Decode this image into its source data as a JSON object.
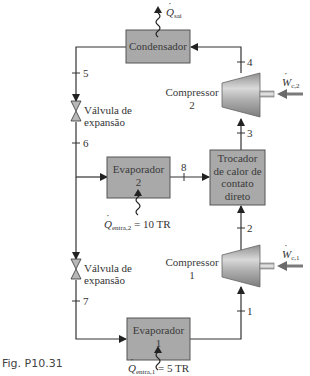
{
  "figure": {
    "caption": "Fig. P10.31",
    "colors": {
      "box_fill": "#a9a9a9",
      "line": "#333333",
      "compressor_light": "#d8d8d8",
      "compressor_dark": "#8a8a8a",
      "work_arrow": "#7a7a7a"
    }
  },
  "components": {
    "condenser": {
      "label": "Condensador"
    },
    "compressor2": {
      "label_line1": "Compressor",
      "label_line2": "2"
    },
    "compressor1": {
      "label_line1": "Compressor",
      "label_line2": "1"
    },
    "heat_exchanger": {
      "line1": "Trocador",
      "line2": "de calor de",
      "line3": "contato",
      "line4": "direto"
    },
    "evaporator2": {
      "line1": "Evaporador",
      "line2": "2"
    },
    "evaporator1": {
      "line1": "Evaporador",
      "line2": "1"
    },
    "valve_upper": {
      "line1": "Válvula de",
      "line2": "expansão"
    },
    "valve_lower": {
      "line1": "Válvula de",
      "line2": "expansão"
    }
  },
  "states": [
    "1",
    "2",
    "3",
    "4",
    "5",
    "6",
    "7",
    "8"
  ],
  "energy": {
    "q_out": {
      "symbol": "Q",
      "sub": "sai"
    },
    "q_in_2": {
      "symbol": "Q",
      "sub": "entra,2",
      "value": "= 10 TR"
    },
    "q_in_1": {
      "symbol": "Q",
      "sub": "entra,1",
      "value": "= 5 TR"
    },
    "w_c2": {
      "symbol": "W",
      "sub": "c,2"
    },
    "w_c1": {
      "symbol": "W",
      "sub": "c,1"
    }
  }
}
